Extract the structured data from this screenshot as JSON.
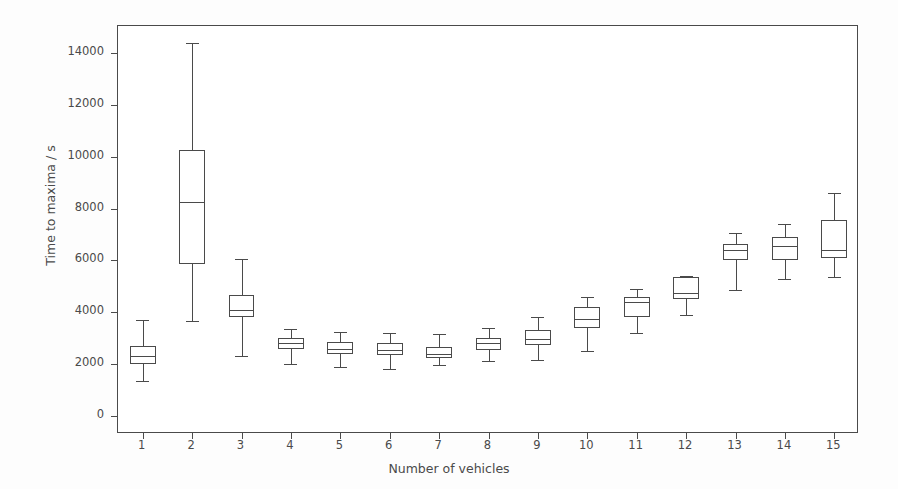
{
  "chart_data": {
    "type": "box",
    "title": "",
    "xlabel": "Number of vehicles",
    "ylabel": "Time to maxima / s",
    "xlim": [
      0.5,
      15.5
    ],
    "ylim": [
      -700,
      15050
    ],
    "grid": false,
    "legend": null,
    "categories": [
      "1",
      "2",
      "3",
      "4",
      "5",
      "6",
      "7",
      "8",
      "9",
      "10",
      "11",
      "12",
      "13",
      "14",
      "15"
    ],
    "yticks": [
      0,
      2000,
      4000,
      6000,
      8000,
      10000,
      12000,
      14000
    ],
    "ytick_labels": [
      "0",
      "2000",
      "4000",
      "6000",
      "8000",
      "10000",
      "12000",
      "14000"
    ],
    "xticks": [
      1,
      2,
      3,
      4,
      5,
      6,
      7,
      8,
      9,
      10,
      11,
      12,
      13,
      14,
      15
    ],
    "xtick_labels": [
      "1",
      "2",
      "3",
      "4",
      "5",
      "6",
      "7",
      "8",
      "9",
      "10",
      "11",
      "12",
      "13",
      "14",
      "15"
    ],
    "boxes": [
      {
        "category": "1",
        "whisker_low": 1350,
        "q1": 2000,
        "median": 2300,
        "q3": 2700,
        "whisker_high": 3700
      },
      {
        "category": "2",
        "whisker_low": 3650,
        "q1": 5850,
        "median": 8250,
        "q3": 10250,
        "whisker_high": 14400
      },
      {
        "category": "3",
        "whisker_low": 2300,
        "q1": 3800,
        "median": 4100,
        "q3": 4650,
        "whisker_high": 6050
      },
      {
        "category": "4",
        "whisker_low": 2000,
        "q1": 2600,
        "median": 2800,
        "q3": 3000,
        "whisker_high": 3350
      },
      {
        "category": "5",
        "whisker_low": 1900,
        "q1": 2400,
        "median": 2600,
        "q3": 2850,
        "whisker_high": 3250
      },
      {
        "category": "6",
        "whisker_low": 1800,
        "q1": 2350,
        "median": 2550,
        "q3": 2800,
        "whisker_high": 3200
      },
      {
        "category": "7",
        "whisker_low": 1950,
        "q1": 2250,
        "median": 2400,
        "q3": 2650,
        "whisker_high": 3150
      },
      {
        "category": "8",
        "whisker_low": 2100,
        "q1": 2550,
        "median": 2800,
        "q3": 3000,
        "whisker_high": 3400
      },
      {
        "category": "9",
        "whisker_low": 2150,
        "q1": 2750,
        "median": 2950,
        "q3": 3300,
        "whisker_high": 3800
      },
      {
        "category": "10",
        "whisker_low": 2500,
        "q1": 3400,
        "median": 3750,
        "q3": 4200,
        "whisker_high": 4600
      },
      {
        "category": "11",
        "whisker_low": 3200,
        "q1": 3800,
        "median": 4400,
        "q3": 4600,
        "whisker_high": 4900
      },
      {
        "category": "12",
        "whisker_low": 3900,
        "q1": 4500,
        "median": 4750,
        "q3": 5350,
        "whisker_high": 5400
      },
      {
        "category": "13",
        "whisker_low": 4850,
        "q1": 6000,
        "median": 6400,
        "q3": 6650,
        "whisker_high": 7050
      },
      {
        "category": "14",
        "whisker_low": 5300,
        "q1": 6000,
        "median": 6550,
        "q3": 6900,
        "whisker_high": 7400
      },
      {
        "category": "15",
        "whisker_low": 5350,
        "q1": 6100,
        "median": 6400,
        "q3": 7550,
        "whisker_high": 8600
      }
    ],
    "colors": {
      "line": "#4a4a4a",
      "box_face": "#ffffff",
      "axes": "#4a4a4a",
      "background": "#ffffff",
      "figure_background": "#fdfdfd",
      "text": "#4a4a4a"
    },
    "box_width_fraction": 0.52,
    "cap_width_fraction": 0.26
  }
}
